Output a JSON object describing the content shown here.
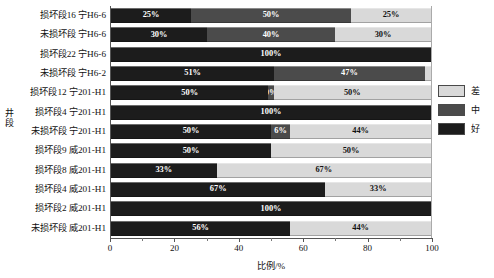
{
  "chart_data": {
    "type": "bar",
    "orientation": "horizontal",
    "stacked": true,
    "title": "",
    "xlabel": "比例/%",
    "ylabel": "井段",
    "xlim": [
      0,
      100
    ],
    "xticks": [
      0,
      20,
      40,
      60,
      80,
      100
    ],
    "xtick_labels": [
      "0",
      "20",
      "40",
      "60",
      "80",
      "100"
    ],
    "grid": false,
    "legend_position": "right",
    "categories": [
      "损坏段16 宁H6-6",
      "未损坏段 宁H6-6",
      "损坏段22 宁H6-6",
      "未损坏段 宁H6-2",
      "损坏段12 宁201-H1",
      "损坏段4 宁201-H1",
      "未损坏段 宁201-H1",
      "损坏段9 威201-H1",
      "损坏段8 威201-H1",
      "损坏段4 威201-H1",
      "损坏段2 威201-H1",
      "未损坏段 威201-H1"
    ],
    "series": [
      {
        "name": "好",
        "color": "#1c1c1c",
        "values": [
          25,
          30,
          100,
          51,
          50,
          100,
          50,
          50,
          33,
          67,
          100,
          56
        ],
        "labels": [
          "25%",
          "30%",
          "100%",
          "51%",
          "50%",
          "100%",
          "50%",
          "50%",
          "33%",
          "67%",
          "100%",
          "56%"
        ]
      },
      {
        "name": "中",
        "color": "#4b4b4b",
        "values": [
          50,
          40,
          0,
          47,
          0,
          0,
          6,
          0,
          0,
          0,
          0,
          0
        ],
        "labels": [
          "50%",
          "40%",
          "",
          "47%",
          "0%",
          "",
          "6%",
          "",
          "",
          "",
          "",
          ""
        ]
      },
      {
        "name": "差",
        "color": "#d9d9d9",
        "values": [
          25,
          30,
          0,
          2,
          50,
          0,
          44,
          50,
          67,
          33,
          0,
          44
        ],
        "labels": [
          "25%",
          "30%",
          "",
          "2%",
          "50%",
          "",
          "44%",
          "50%",
          "67%",
          "33%",
          "",
          "44%"
        ]
      }
    ]
  },
  "legend": {
    "items": [
      {
        "label": "差",
        "color": "#d9d9d9"
      },
      {
        "label": "中",
        "color": "#4b4b4b"
      },
      {
        "label": "好",
        "color": "#1c1c1c"
      }
    ]
  },
  "axes": {
    "y_title_chars": [
      "井",
      "段"
    ],
    "x_title": "比例/%"
  }
}
